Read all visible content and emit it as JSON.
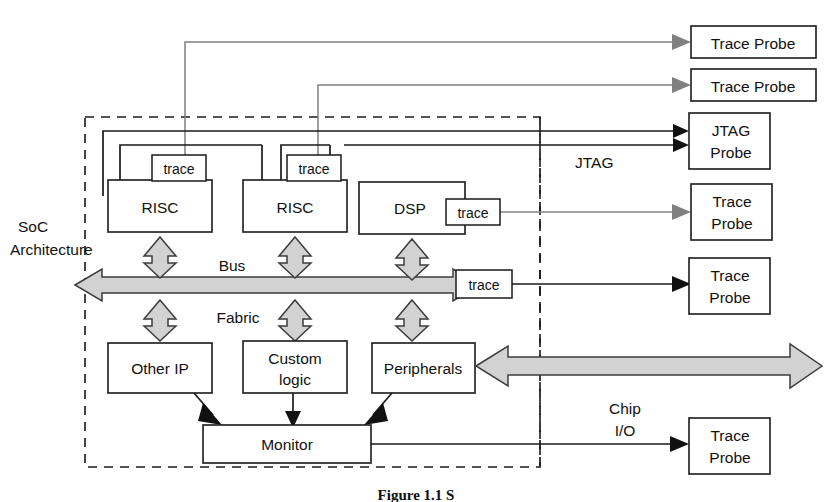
{
  "figure": {
    "caption": "Figure 1.1 S",
    "background_color": "#ffffff",
    "line_color": "#1a1a1a",
    "gray_fill_color": "#d2d2d2",
    "gray_line_color": "#808080"
  },
  "side_labels": {
    "soc_line1": "SoC",
    "soc_line2": "Architecture",
    "jtag": "JTAG",
    "chip_io_line1": "Chip",
    "chip_io_line2": "I/O"
  },
  "bus": {
    "label_line1": "Bus",
    "label_line2": "Fabric"
  },
  "cores": [
    {
      "name": "RISC",
      "trace_label": "trace"
    },
    {
      "name": "RISC",
      "trace_label": "trace"
    },
    {
      "name": "DSP",
      "trace_label": "trace"
    }
  ],
  "bus_trace": {
    "label": "trace"
  },
  "peripheral_blocks": [
    {
      "name": "Other IP"
    },
    {
      "name_line1": "Custom",
      "name_line2": "logic"
    },
    {
      "name": "Peripherals"
    }
  ],
  "monitor": {
    "name": "Monitor"
  },
  "probes": [
    {
      "id": "trace-probe-1",
      "label": "Trace Probe",
      "single_line": true
    },
    {
      "id": "trace-probe-2",
      "label": "Trace Probe",
      "single_line": true
    },
    {
      "id": "jtag-probe",
      "line1": "JTAG",
      "line2": "Probe",
      "single_line": false
    },
    {
      "id": "trace-probe-3",
      "line1": "Trace",
      "line2": "Probe",
      "single_line": false
    },
    {
      "id": "trace-probe-4",
      "line1": "Trace",
      "line2": "Probe",
      "single_line": false
    },
    {
      "id": "trace-probe-5",
      "line1": "Trace",
      "line2": "Probe",
      "single_line": false
    }
  ]
}
